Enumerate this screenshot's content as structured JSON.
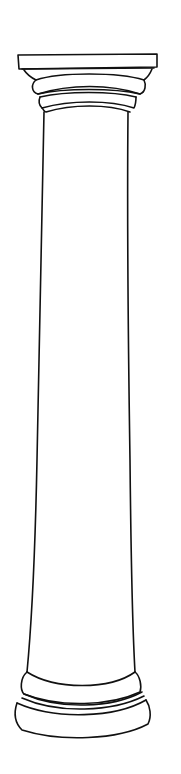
{
  "image": {
    "subject": "Line drawing of a classical Tuscan column",
    "parts": [
      "abacus",
      "capital moldings",
      "shaft",
      "base moldings"
    ],
    "colors": {
      "background": "#ffffff",
      "stroke": "#111111"
    }
  }
}
